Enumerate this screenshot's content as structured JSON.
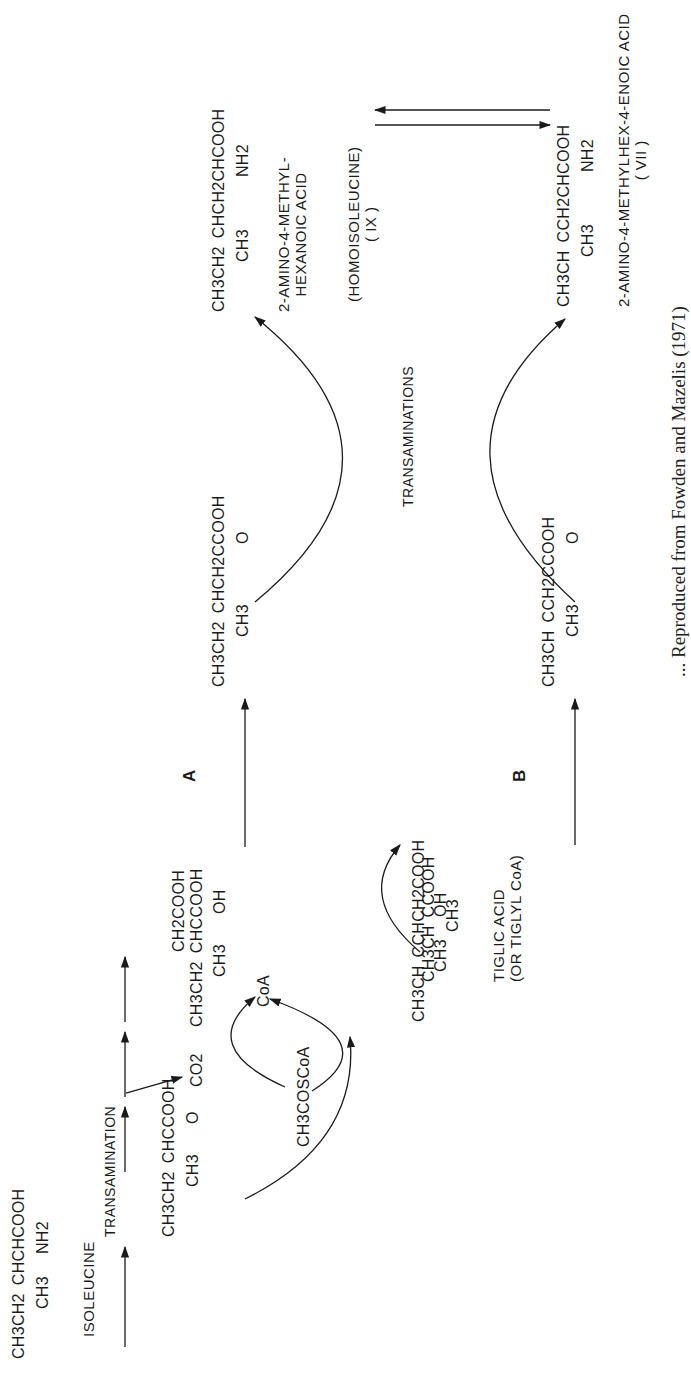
{
  "figure": {
    "orientation": "rotated 90 degrees counter-clockwise",
    "pathway_labels": {
      "A": "A",
      "B": "B"
    },
    "process_labels": {
      "transamination": "TRANSAMINATION",
      "transaminations": "TRANSAMINATIONS"
    },
    "compounds": {
      "isoleucine": {
        "formula_top": "CH3CH2",
        "formula_main": "CHCHCOOH",
        "substituent_ch3": "CH3",
        "substituent_nh2": "NH2",
        "name": "ISOLEUCINE"
      },
      "keto_acid": {
        "formula_top": "CH3CH2",
        "formula_main": "CHCCOOH",
        "substituent_ch3": "CH3",
        "substituent_o": "O"
      },
      "co2": {
        "formula": "CO2"
      },
      "acetyl_coa": {
        "formula": "CH3COSCoA"
      },
      "coa": {
        "formula": "CoA"
      },
      "tiglic_acid": {
        "formula_top": "CH3CH",
        "formula_main": "CCOOH",
        "substituent_ch3": "CH3",
        "name_line1": "TIGLIC ACID",
        "name_line2": "(OR TIGLYL CoA)"
      },
      "hydroxy_acid_a": {
        "formula_top": "CH3CH2",
        "formula_branch": "CH2COOH",
        "formula_main": "CHCCOOH",
        "substituent_ch3": "CH3",
        "substituent_oh": "OH"
      },
      "hydroxy_acid_b": {
        "formula_top": "CH3CH",
        "formula_main": "CCHCH2COOH",
        "substituent_ch3": "CH3",
        "substituent_oh": "OH"
      },
      "keto_a": {
        "formula_top": "CH3CH2",
        "formula_main": "CHCH2CCOOH",
        "substituent_ch3": "CH3",
        "substituent_o": "O"
      },
      "keto_b": {
        "formula_top": "CH3CH",
        "formula_main": "CCH2CCOOH",
        "substituent_ch3": "CH3",
        "substituent_o": "O"
      },
      "homoisoleucine": {
        "formula_top": "CH3CH2",
        "formula_main": "CHCH2CHCOOH",
        "substituent_ch3": "CH3",
        "substituent_nh2": "NH2",
        "name_line1": "2-AMINO-4-METHYL-",
        "name_line2": "HEXANOIC ACID",
        "alias": "(HOMOISOLEUCINE)",
        "number": "( IX )"
      },
      "amino_enoic_acid": {
        "formula_top": "CH3CH",
        "formula_main": "CCH2CHCOOH",
        "substituent_ch3": "CH3",
        "substituent_nh2": "NH2",
        "name": "2-AMINO-4-METHYLHEX-4-ENOIC ACID",
        "number": "( VII )"
      }
    },
    "caption_visible_fragment": "... Reproduced from Fowden and Mazelis (1971)"
  }
}
